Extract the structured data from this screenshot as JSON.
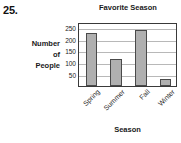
{
  "question": {
    "number": "25."
  },
  "chart_data": {
    "type": "bar",
    "title": "Favorite Season",
    "xlabel": "Season",
    "ylabel": "Number of People",
    "ylabel_lines": [
      "Number",
      "of",
      "People"
    ],
    "categories": [
      "Spring",
      "Summer",
      "Fall",
      "Winter"
    ],
    "values": [
      225,
      115,
      235,
      30
    ],
    "yticks": [
      250,
      200,
      150,
      100,
      50
    ],
    "ylim": [
      0,
      270
    ],
    "grid": true,
    "legend": false,
    "bar_color": "#b0b0b0",
    "bar_border_color": "#4a4a4a",
    "gridline_color": "#b8b8b8",
    "frame_color": "#3a3a3a",
    "tick_label_rotation": -45
  }
}
